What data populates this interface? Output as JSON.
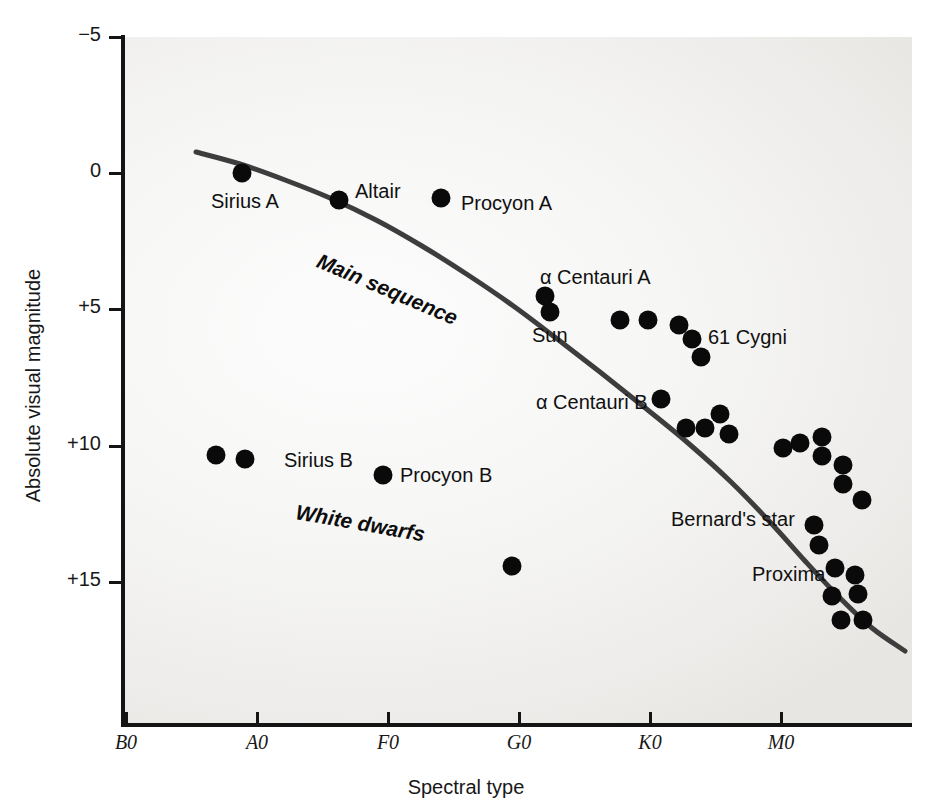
{
  "figure": {
    "background_color": "#ffffff",
    "plot_background_color": "#f2f1ef",
    "ink_color": "#141414"
  },
  "axes": {
    "y_title": "Absolute visual magnitude",
    "x_title": "Spectral type",
    "y_ticks": [
      {
        "label": "−5",
        "value": -5,
        "y": 37
      },
      {
        "label": "0",
        "value": 0,
        "y": 173
      },
      {
        "label": "+5",
        "value": 5,
        "y": 309
      },
      {
        "label": "+10",
        "value": 10,
        "y": 446
      },
      {
        "label": "+15",
        "value": 15,
        "y": 582
      }
    ],
    "x_ticks": [
      {
        "label": "B0",
        "x": 126
      },
      {
        "label": "A0",
        "x": 257
      },
      {
        "label": "F0",
        "x": 388
      },
      {
        "label": "G0",
        "x": 519
      },
      {
        "label": "K0",
        "x": 650
      },
      {
        "label": "M0",
        "x": 781
      }
    ]
  },
  "regions": [
    {
      "name": "main-sequence",
      "label": "Main sequence"
    },
    {
      "name": "white-dwarfs",
      "label": "White dwarfs"
    }
  ],
  "star_labels": [
    {
      "name": "sirius-a",
      "text": "Sirius A",
      "x": 211,
      "y": 190
    },
    {
      "name": "altair",
      "text": "Altair",
      "x": 355,
      "y": 180
    },
    {
      "name": "procyon-a",
      "text": "Procyon A",
      "x": 461,
      "y": 192
    },
    {
      "name": "alpha-cen-a",
      "text": "α Centauri A",
      "x": 540,
      "y": 266
    },
    {
      "name": "sun",
      "text": "Sun",
      "x": 532,
      "y": 324
    },
    {
      "name": "61-cygni",
      "text": "61 Cygni",
      "x": 708,
      "y": 326
    },
    {
      "name": "alpha-cen-b",
      "text": "α Centauri B",
      "x": 536,
      "y": 391
    },
    {
      "name": "sirius-b",
      "text": "Sirius B",
      "x": 284,
      "y": 449
    },
    {
      "name": "procyon-b",
      "text": "Procyon B",
      "x": 400,
      "y": 464
    },
    {
      "name": "bernards-star",
      "text": "Bernard's star",
      "x": 671,
      "y": 508
    },
    {
      "name": "proxima",
      "text": "Proxima",
      "x": 752,
      "y": 563
    }
  ],
  "chart_data": {
    "type": "scatter",
    "title": "",
    "xlabel": "Spectral type",
    "ylabel": "Absolute visual magnitude",
    "xlim": [
      "B0",
      "M8"
    ],
    "ylim": [
      -5,
      17.5
    ],
    "y_invert": true,
    "grid": false,
    "legend": "none",
    "annotations": [
      "Main sequence",
      "White dwarfs"
    ],
    "main_sequence_curve": {
      "name": "Main sequence",
      "color": "#3d3d3d",
      "width": 5,
      "path_px": [
        [
          196,
          152
        ],
        [
          240,
          164
        ],
        [
          285,
          180
        ],
        [
          330,
          198
        ],
        [
          376,
          220
        ],
        [
          422,
          246
        ],
        [
          468,
          275
        ],
        [
          512,
          305
        ],
        [
          556,
          338
        ],
        [
          600,
          372
        ],
        [
          644,
          407
        ],
        [
          688,
          443
        ],
        [
          730,
          481
        ],
        [
          770,
          522
        ],
        [
          806,
          562
        ],
        [
          840,
          598
        ],
        [
          872,
          628
        ],
        [
          905,
          651
        ]
      ]
    },
    "points": [
      {
        "label": "Sirius A",
        "x_px": 242,
        "y_px": 173,
        "spectral": "A1",
        "magnitude": 1.4
      },
      {
        "label": "Altair",
        "x_px": 339,
        "y_px": 200,
        "spectral": "A7",
        "magnitude": 2.2
      },
      {
        "label": "Procyon A",
        "x_px": 441,
        "y_px": 198,
        "spectral": "F5",
        "magnitude": 2.6
      },
      {
        "label": "α Centauri A",
        "x_px": 545,
        "y_px": 296,
        "spectral": "G2",
        "magnitude": 4.4
      },
      {
        "label": "Sun",
        "x_px": 550,
        "y_px": 312,
        "spectral": "G2",
        "magnitude": 4.8
      },
      {
        "label": "",
        "x_px": 620,
        "y_px": 320,
        "spectral": "K0",
        "magnitude": 5.1
      },
      {
        "label": "",
        "x_px": 648,
        "y_px": 320,
        "spectral": "K1",
        "magnitude": 5.1
      },
      {
        "label": "",
        "x_px": 679,
        "y_px": 325,
        "spectral": "K2",
        "magnitude": 5.3
      },
      {
        "label": "61 Cygni",
        "x_px": 692,
        "y_px": 339,
        "spectral": "K5",
        "magnitude": 7.5
      },
      {
        "label": "",
        "x_px": 701,
        "y_px": 357,
        "spectral": "K6",
        "magnitude": 8.3
      },
      {
        "label": "α Centauri B",
        "x_px": 661,
        "y_px": 399,
        "spectral": "K1",
        "magnitude": 5.7
      },
      {
        "label": "",
        "x_px": 720,
        "y_px": 414,
        "spectral": "K7",
        "magnitude": 8.4
      },
      {
        "label": "",
        "x_px": 705,
        "y_px": 428,
        "spectral": "K7",
        "magnitude": 8.8
      },
      {
        "label": "",
        "x_px": 686,
        "y_px": 428,
        "spectral": "K6",
        "magnitude": 8.9
      },
      {
        "label": "Sirius B",
        "x_px": 245,
        "y_px": 459,
        "spectral": "A2",
        "magnitude": 11.3
      },
      {
        "label": "",
        "x_px": 216,
        "y_px": 455,
        "spectral": "A0",
        "magnitude": 11.2
      },
      {
        "label": "Procyon B",
        "x_px": 383,
        "y_px": 475,
        "spectral": "F0",
        "magnitude": 12.0
      },
      {
        "label": "",
        "x_px": 512,
        "y_px": 566,
        "spectral": "G5",
        "magnitude": 15.4
      },
      {
        "label": "",
        "x_px": 783,
        "y_px": 448,
        "spectral": "M0",
        "magnitude": 10.0
      },
      {
        "label": "",
        "x_px": 800,
        "y_px": 443,
        "spectral": "M1",
        "magnitude": 9.8
      },
      {
        "label": "",
        "x_px": 822,
        "y_px": 437,
        "spectral": "M1",
        "magnitude": 9.6
      },
      {
        "label": "",
        "x_px": 822,
        "y_px": 456,
        "spectral": "M1",
        "magnitude": 10.2
      },
      {
        "label": "",
        "x_px": 843,
        "y_px": 465,
        "spectral": "M2",
        "magnitude": 10.5
      },
      {
        "label": "",
        "x_px": 843,
        "y_px": 484,
        "spectral": "M2",
        "magnitude": 11.1
      },
      {
        "label": "",
        "x_px": 862,
        "y_px": 500,
        "spectral": "M3",
        "magnitude": 11.6
      },
      {
        "label": "Bernard's star",
        "x_px": 814,
        "y_px": 525,
        "spectral": "M4",
        "magnitude": 13.2
      },
      {
        "label": "",
        "x_px": 819,
        "y_px": 545,
        "spectral": "M4",
        "magnitude": 13.5
      },
      {
        "label": "",
        "x_px": 835,
        "y_px": 568,
        "spectral": "M4",
        "magnitude": 14.2
      },
      {
        "label": "",
        "x_px": 855,
        "y_px": 575,
        "spectral": "M5",
        "magnitude": 14.4
      },
      {
        "label": "",
        "x_px": 832,
        "y_px": 596,
        "spectral": "M5",
        "magnitude": 15.2
      },
      {
        "label": "",
        "x_px": 858,
        "y_px": 594,
        "spectral": "M5",
        "magnitude": 15.1
      },
      {
        "label": "Proxima",
        "x_px": 841,
        "y_px": 620,
        "spectral": "M5",
        "magnitude": 15.9
      },
      {
        "label": "",
        "x_px": 863,
        "y_px": 620,
        "spectral": "M6",
        "magnitude": 15.9
      },
      {
        "label": "",
        "x_px": 729,
        "y_px": 434,
        "spectral": "K7",
        "magnitude": 9.1
      }
    ]
  }
}
